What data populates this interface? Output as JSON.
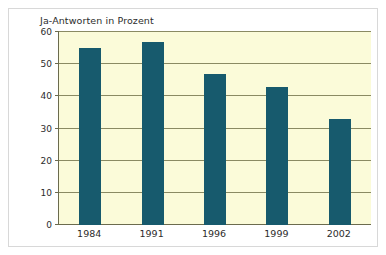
{
  "chart_data": {
    "type": "bar",
    "title": "Ja-Antworten in Prozent",
    "xlabel": "",
    "ylabel": "",
    "categories": [
      "1984",
      "1991",
      "1996",
      "1999",
      "2002"
    ],
    "values": [
      55,
      57,
      47,
      43,
      33
    ],
    "ylim": [
      0,
      60
    ],
    "yticks": [
      0,
      10,
      20,
      30,
      40,
      50,
      60
    ],
    "ytick_labels": [
      "0",
      "10",
      "20",
      "30",
      "40",
      "50",
      "60"
    ],
    "grid": true,
    "legend": null,
    "series": [
      {
        "name": "Ja-Antworten in Prozent",
        "values": [
          55,
          57,
          47,
          43,
          33
        ]
      }
    ],
    "colors": {
      "bar": "#175a6d",
      "plot_background": "#fbfbd9",
      "gridline": "#8a8a63",
      "axis": "#6b6b4e",
      "text": "#2c2c2c",
      "figure_background": "#ffffff",
      "figure_border": "#d8d8d8"
    }
  }
}
